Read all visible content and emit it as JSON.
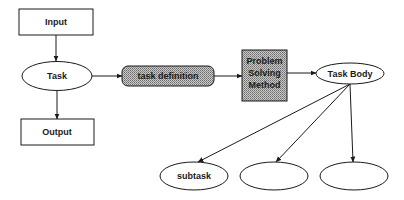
{
  "diagram": {
    "nodes": [
      {
        "id": "input",
        "label": "Input",
        "shape": "rectangle",
        "fill": "plain"
      },
      {
        "id": "task",
        "label": "Task",
        "shape": "ellipse",
        "fill": "plain"
      },
      {
        "id": "output",
        "label": "Output",
        "shape": "rectangle",
        "fill": "plain"
      },
      {
        "id": "task_definition",
        "label": "task definition",
        "shape": "rounded-rectangle",
        "fill": "shaded"
      },
      {
        "id": "psm",
        "label_lines": [
          "Problem",
          "Solving",
          "Method"
        ],
        "shape": "rectangle",
        "fill": "shaded"
      },
      {
        "id": "task_body",
        "label": "Task Body",
        "shape": "ellipse",
        "fill": "plain"
      },
      {
        "id": "subtask",
        "label": "subtask",
        "shape": "ellipse",
        "fill": "plain"
      },
      {
        "id": "blank_1",
        "label": "",
        "shape": "ellipse",
        "fill": "plain"
      },
      {
        "id": "blank_2",
        "label": "",
        "shape": "ellipse",
        "fill": "plain"
      }
    ],
    "edges": [
      {
        "from": "input",
        "to": "task"
      },
      {
        "from": "task",
        "to": "output"
      },
      {
        "from": "task",
        "to": "task_definition"
      },
      {
        "from": "task_definition",
        "to": "psm"
      },
      {
        "from": "psm",
        "to": "task_body"
      },
      {
        "from": "task_body",
        "to": "subtask"
      },
      {
        "from": "task_body",
        "to": "blank_1"
      },
      {
        "from": "task_body",
        "to": "blank_2"
      }
    ],
    "colors": {
      "stroke": "#1a1a1a",
      "shade_base": "#c8c8c8",
      "shade_dot": "#6e6e6e",
      "background": "#ffffff"
    }
  }
}
